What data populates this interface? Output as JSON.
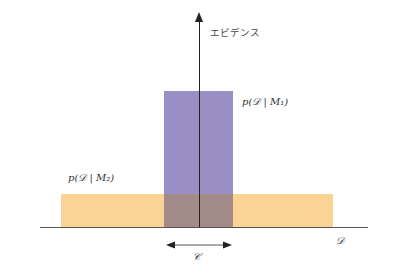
{
  "diagram": {
    "y_axis_label": "エビデンス",
    "x_axis_label": "𝒟",
    "bracket_label": "𝒞",
    "model_1_label": "p(𝒟 | M₁)",
    "model_2_label": "p(𝒟 | M₂)",
    "colors": {
      "model_1_fill": "#9a8fc4",
      "model_2_fill": "#fbd394",
      "overlap_fill": "#a38b8a",
      "axis": "#222222"
    }
  }
}
